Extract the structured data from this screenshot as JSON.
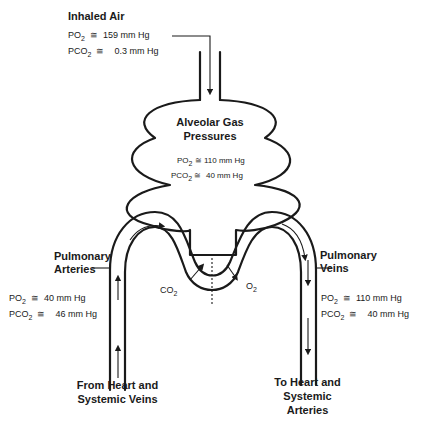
{
  "inhaled_air": {
    "title": "Inhaled Air",
    "po2_label": "PO",
    "po2_sub": "2",
    "po2_value": "159 mm Hg",
    "pco2_label": "PCO",
    "pco2_sub": "2",
    "pco2_value": "0.3 mm Hg"
  },
  "alveolar": {
    "title_line1": "Alveolar Gas",
    "title_line2": "Pressures",
    "po2_label": "PO",
    "po2_sub": "2",
    "po2_value": "110 mm Hg",
    "pco2_label": "PCO",
    "pco2_sub": "2",
    "pco2_value": "40 mm Hg"
  },
  "pulmonary_arteries": {
    "title_line1": "Pulmonary",
    "title_line2": "Arteries",
    "po2_label": "PO",
    "po2_sub": "2",
    "po2_value": "40 mm Hg",
    "pco2_label": "PCO",
    "pco2_sub": "2",
    "pco2_value": "46 mm Hg"
  },
  "pulmonary_veins": {
    "title_line1": "Pulmonary",
    "title_line2": "Veins",
    "po2_label": "PO",
    "po2_sub": "2",
    "po2_value": "110 mm Hg",
    "pco2_label": "PCO",
    "pco2_sub": "2",
    "pco2_value": "40 mm Hg"
  },
  "exchange": {
    "co2_label": "CO",
    "co2_sub": "2",
    "o2_label": "O",
    "o2_sub": "2"
  },
  "bottom_left": {
    "line1": "From Heart and",
    "line2": "Systemic Veins"
  },
  "bottom_right": {
    "line1": "To Heart and",
    "line2": "Systemic",
    "line3": "Arteries"
  },
  "approx_symbol": "≅",
  "colors": {
    "line": "#1a1a1a",
    "background": "#ffffff"
  }
}
